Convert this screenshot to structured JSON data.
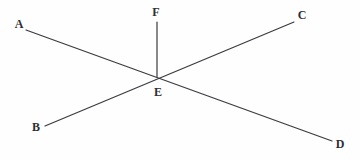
{
  "diagram": {
    "type": "geometry-line-diagram",
    "canvas": {
      "width": 360,
      "height": 160,
      "background": "#fefefe"
    },
    "style": {
      "line_color": "#3a3a40",
      "line_width": 1.2,
      "label_color": "#2e2e33",
      "label_font_size": 12
    },
    "points": [
      {
        "id": "A",
        "label": "A",
        "x": 26,
        "y": 30,
        "label_x": 19,
        "label_y": 24
      },
      {
        "id": "B",
        "label": "B",
        "x": 45,
        "y": 126,
        "label_x": 36,
        "label_y": 127
      },
      {
        "id": "C",
        "label": "C",
        "x": 294,
        "y": 22,
        "label_x": 302,
        "label_y": 15
      },
      {
        "id": "D",
        "label": "D",
        "x": 332,
        "y": 141,
        "label_x": 340,
        "label_y": 144
      },
      {
        "id": "E",
        "label": "E",
        "x": 157,
        "y": 77,
        "label_x": 158,
        "label_y": 92
      },
      {
        "id": "F",
        "label": "F",
        "x": 157,
        "y": 22,
        "label_x": 156,
        "label_y": 12
      }
    ],
    "segments": [
      {
        "id": "AD",
        "from": "A",
        "to": "D",
        "x1": 26,
        "y1": 30,
        "x2": 332,
        "y2": 141
      },
      {
        "id": "BC",
        "from": "B",
        "to": "C",
        "x1": 45,
        "y1": 126,
        "x2": 294,
        "y2": 22
      },
      {
        "id": "EF",
        "from": "E",
        "to": "F",
        "x1": 157,
        "y1": 77,
        "x2": 157,
        "y2": 22
      }
    ]
  }
}
